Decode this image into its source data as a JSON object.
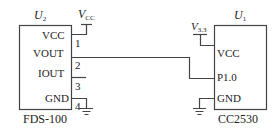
{
  "diagram": {
    "type": "circuit-schematic",
    "components": [
      {
        "id": "U2",
        "ref_label": "U",
        "ref_sub": "2",
        "part": "FDS-100",
        "pins": [
          {
            "name": "VCC",
            "number": "1"
          },
          {
            "name": "VOUT",
            "number": "2"
          },
          {
            "name": "IOUT",
            "number": "3"
          },
          {
            "name": "GND",
            "number": "4"
          }
        ]
      },
      {
        "id": "U1",
        "ref_label": "U",
        "ref_sub": "1",
        "part": "CC2530",
        "pins": [
          {
            "name": "VCC"
          },
          {
            "name": "P1.0"
          },
          {
            "name": "GND"
          }
        ]
      }
    ],
    "supplies": [
      {
        "label": "V",
        "sub": "CC",
        "connects": "U2.VCC"
      },
      {
        "label": "V",
        "sub": "3.3",
        "connects": "U1.VCC"
      }
    ],
    "connections": [
      {
        "from": "U2.VOUT",
        "to": "U1.P1.0"
      },
      {
        "from": "U2.GND",
        "to": "ground"
      },
      {
        "from": "U1.GND",
        "to": "ground"
      }
    ],
    "colors": {
      "line": "#444444",
      "text": "#222222",
      "background": "#ffffff"
    }
  }
}
